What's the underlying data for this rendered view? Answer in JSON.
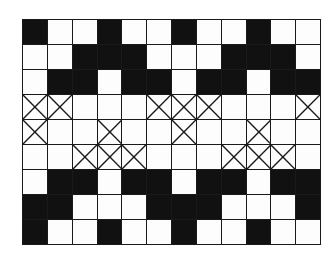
{
  "diagram": {
    "type": "pattern-grid",
    "columns": 12,
    "rows": 9,
    "legend": {
      "B": "filled black cell",
      "W": "empty white cell",
      "X": "crossed cell"
    },
    "colors": {
      "filled": "#111111",
      "empty": "#fdfdfd",
      "line": "#1a1a1a"
    },
    "cells": [
      [
        "B",
        "W",
        "W",
        "B",
        "W",
        "W",
        "B",
        "W",
        "W",
        "B",
        "W",
        "W"
      ],
      [
        "W",
        "W",
        "B",
        "B",
        "B",
        "W",
        "W",
        "W",
        "B",
        "B",
        "B",
        "W"
      ],
      [
        "W",
        "B",
        "B",
        "W",
        "B",
        "B",
        "W",
        "B",
        "B",
        "W",
        "B",
        "B"
      ],
      [
        "X",
        "X",
        "W",
        "W",
        "W",
        "X",
        "X",
        "X",
        "W",
        "W",
        "W",
        "X"
      ],
      [
        "X",
        "W",
        "W",
        "X",
        "W",
        "W",
        "X",
        "W",
        "W",
        "X",
        "W",
        "W"
      ],
      [
        "W",
        "W",
        "X",
        "X",
        "X",
        "W",
        "W",
        "W",
        "X",
        "X",
        "X",
        "W"
      ],
      [
        "W",
        "B",
        "B",
        "W",
        "B",
        "B",
        "W",
        "B",
        "B",
        "W",
        "B",
        "B"
      ],
      [
        "B",
        "B",
        "W",
        "W",
        "W",
        "B",
        "B",
        "B",
        "W",
        "W",
        "W",
        "B"
      ],
      [
        "B",
        "W",
        "W",
        "B",
        "W",
        "W",
        "B",
        "W",
        "W",
        "B",
        "W",
        "W"
      ]
    ]
  }
}
